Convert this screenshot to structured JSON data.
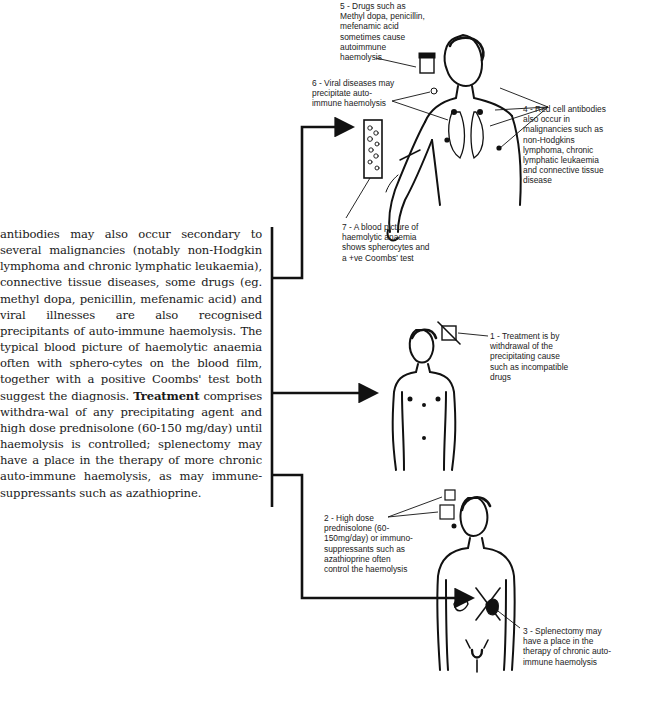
{
  "body_text": {
    "part1": "antibodies may also occur secondary to several malignancies (notably non-Hodgkin lymphoma and chronic lymphatic leukaemia), connective tissue diseases, some drugs (eg. methyl dopa, penicillin, mefenamic acid) and viral illnesses are also recognised precipitants of auto-immune haemolysis. The typical blood picture of haemolytic anaemia often with sphero-cytes on the blood film, together with a positive Coombs' test both suggest the diagnosis.",
    "bold": "Treatment",
    "part2": "comprises withdra-wal of any precipitating agent and high dose prednisolone (60-150 mg/day) until haemolysis is controlled; splenectomy may have a place in the therapy of more chronic auto-immune haemolysis, as may immune-suppressants such as azathioprine."
  },
  "labels": {
    "label5": "5 - Drugs such as\nMethyl dopa, penicillin,\nmefenamic acid\nsometimes cause\nautoimmune\nhaemolysis",
    "label6": "6 - Viral diseases may\nprecipitate auto-\nimmune haemolysis",
    "label4": "4 - Red cell antibodies\nalso occur in\nmalignancies such as\nnon-Hodgkins\nlymphoma, chronic\nlymphatic leukaemia\nand connective tissue\ndisease",
    "label7": "7 - A blood picture of\nhaemolytic anaemia\nshows spherocytes and\na +ve Coombs' test",
    "label1": "1 - Treatment is by\nwithdrawal of the\nprecipitating cause\nsuch as incompatible\ndrugs",
    "label2": "2 - High dose\nprednisolone (60-\n150mg/day) or immuno-\nsuppressants such as\nazathioprine often\ncontrol the haemolysis",
    "label3": "3 - Splenectomy may\nhave a place in the\ntherapy of chronic auto-\nimmune haemolysis"
  },
  "colors": {
    "ink": "#1a1a1a",
    "paper": "#ffffff"
  }
}
